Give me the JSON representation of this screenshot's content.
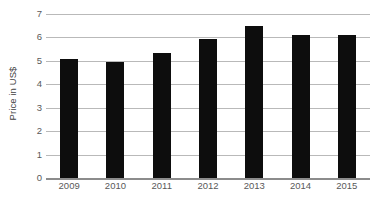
{
  "chart_data": {
    "type": "bar",
    "title": "",
    "subtitle": "",
    "xlabel": "",
    "ylabel": "Price in US$",
    "categories": [
      "2009",
      "2010",
      "2011",
      "2012",
      "2013",
      "2014",
      "2015"
    ],
    "values": [
      5.1,
      4.95,
      5.35,
      5.95,
      6.5,
      6.1,
      6.1
    ],
    "series": [
      {
        "name": "Price in US$",
        "values": [
          5.1,
          4.95,
          5.35,
          5.95,
          6.5,
          6.1,
          6.1
        ]
      }
    ],
    "ylim": [
      0,
      7
    ],
    "ytick_labels": [
      "0",
      "1",
      "2",
      "3",
      "4",
      "5",
      "6",
      "7"
    ],
    "ytick_values": [
      0,
      1,
      2,
      3,
      4,
      5,
      6,
      7
    ],
    "grid": true,
    "grid_axis": "y",
    "legend": false,
    "legend_position": "none",
    "annotations": [],
    "colors": {
      "bar": "#0d0d0d",
      "gridline": "#b9b9b9",
      "axis": "#8c8c8c",
      "tick_text": "#595959",
      "axis_title_text": "#3f3f3f",
      "background": "#ffffff"
    }
  }
}
